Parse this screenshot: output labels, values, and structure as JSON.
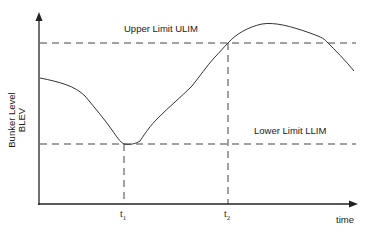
{
  "diagram": {
    "title": "",
    "y_axis_label_line1": "Bunker Level",
    "y_axis_label_line2": "BLEV",
    "x_axis_label": "time",
    "upper_limit_label": "Upper Limit  ULIM",
    "lower_limit_label": "Lower Limit  LLIM",
    "time_markers": [
      {
        "label": "t",
        "subscript": "1"
      },
      {
        "label": "t",
        "subscript": "2"
      }
    ],
    "colors": {
      "line": "#333333",
      "dashed": "#444444",
      "text": "#1a1a1a",
      "background": "#ffffff"
    },
    "curve_description": "Bunker level decreases from start, reaches Lower Limit at t1, rises to Upper Limit at t2, peaks above ULIM, then falls back below ULIM"
  }
}
